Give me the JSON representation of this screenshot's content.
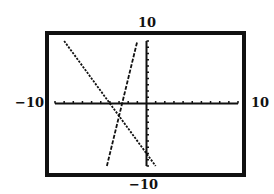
{
  "chart_data": {
    "type": "line",
    "title": "",
    "xlabel": "",
    "ylabel": "",
    "xlim": [
      -10,
      10
    ],
    "ylim": [
      -10,
      10
    ],
    "grid": false,
    "axis_ticks": {
      "x_step": 1,
      "y_step": 1
    },
    "window_labels": {
      "xmin": "−10",
      "xmax": "10",
      "ymin": "−10",
      "ymax": "10"
    },
    "series": [
      {
        "name": "line-decreasing",
        "equation": "y = -2x - 8",
        "slope": -2,
        "intercept": -8,
        "style": "dotted",
        "x": [
          -9,
          1
        ],
        "y": [
          10,
          -10
        ]
      },
      {
        "name": "line-increasing",
        "equation": "y = 6x + 16",
        "slope": 6,
        "intercept": 16,
        "style": "dashed",
        "x": [
          -4.33,
          -1
        ],
        "y": [
          -10,
          10
        ]
      }
    ],
    "intersection": {
      "x": -3,
      "y": -2
    }
  },
  "colors": {
    "ink": "#111111",
    "background": "#ffffff"
  }
}
